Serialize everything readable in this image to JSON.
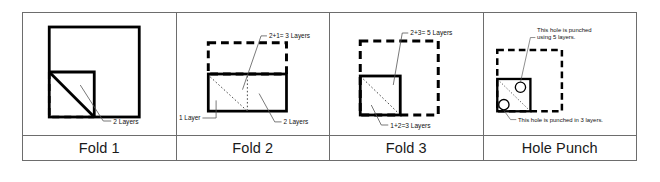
{
  "figure": {
    "background_color": "#ffffff",
    "stroke_color": "#000000",
    "grid_line_color": "#6d6d6d"
  },
  "panels": [
    {
      "id": "fold-1",
      "caption": "Fold 1",
      "annotations": [
        {
          "id": "fold1-layers",
          "text": "2 Layers"
        }
      ],
      "shapes": {
        "solid_square": true,
        "dashed_corner": true,
        "diagonal_fold": true
      }
    },
    {
      "id": "fold-2",
      "caption": "Fold 2",
      "annotations": [
        {
          "id": "fold2-top",
          "text": "2+1= 3 Layers"
        },
        {
          "id": "fold2-left",
          "text": "1 Layer"
        },
        {
          "id": "fold2-right",
          "text": "2 Layers"
        }
      ],
      "shapes": {
        "dashed_rect_top": true,
        "solid_rect_bottom": true,
        "dotted_diagonal": true,
        "dotted_vertical": true
      }
    },
    {
      "id": "fold-3",
      "caption": "Fold 3",
      "annotations": [
        {
          "id": "fold3-top",
          "text": "2+3= 5 Layers"
        },
        {
          "id": "fold3-bottom",
          "text": "1+2=3 Layers"
        }
      ],
      "shapes": {
        "dashed_square": true,
        "solid_square_quadrant": true,
        "dotted_diagonal": true
      }
    },
    {
      "id": "hole-punch",
      "caption": "Hole Punch",
      "annotations": [
        {
          "id": "punch-top-line1",
          "text": "This hole is punched"
        },
        {
          "id": "punch-top-line2",
          "text": "using 5 layers."
        },
        {
          "id": "punch-bottom",
          "text": "This hole is punched in 3 layers."
        }
      ],
      "shapes": {
        "dashed_square": true,
        "solid_square_quadrant": true,
        "dotted_diagonal": true,
        "hole_upper": true,
        "hole_lower": true
      }
    }
  ]
}
